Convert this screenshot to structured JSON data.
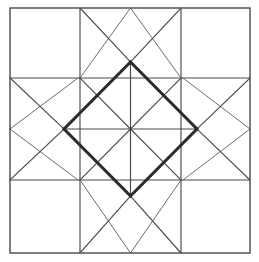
{
  "figure": {
    "name": "quilt-block-diagram",
    "canvas": {
      "width": 259,
      "height": 262,
      "background": "#ffffff"
    },
    "colors": {
      "thin_line": "#4a4a4a",
      "frame_line": "#555555",
      "bold_line": "#2b2b2b",
      "faint_line": "#6d6d6d",
      "background": "#ffffff"
    },
    "geometry": {
      "outer": {
        "left": 10,
        "top": 8,
        "right": 250,
        "bottom": 253
      },
      "grid_x": [
        10,
        80,
        181,
        250
      ],
      "grid_y": [
        8,
        78,
        180,
        253
      ],
      "center": {
        "x": 130.5,
        "y": 129
      },
      "diamond_vertices": {
        "top": {
          "x": 130.5,
          "y": 62
        },
        "right": {
          "x": 197,
          "y": 129
        },
        "bottom": {
          "x": 130.5,
          "y": 196
        },
        "left": {
          "x": 64,
          "y": 129
        }
      }
    },
    "parts": {
      "outer_frame": "outer-square-border",
      "inner_square": "inner-square-between-grid-lines",
      "bold_diamond": "central-bold-diamond",
      "pinwheel": "eight-spoke-center-pinwheel",
      "corner_squares": [
        "top-left-corner-square",
        "top-right-corner-square",
        "bottom-left-corner-square",
        "bottom-right-corner-square"
      ],
      "edge_panels": [
        "top-edge-triangles",
        "right-edge-triangles",
        "bottom-edge-triangles",
        "left-edge-triangles"
      ]
    },
    "lines": {
      "frame": [
        {
          "name": "outer-border",
          "d": "M10,8 L250,8 L250,253 L10,253 Z"
        }
      ],
      "grid": [
        {
          "name": "grid-vertical-left-top",
          "d": "M80,8 L80,78"
        },
        {
          "name": "grid-vertical-right-top",
          "d": "M181,8 L181,78"
        },
        {
          "name": "grid-vertical-left-bottom",
          "d": "M80,180 L80,253"
        },
        {
          "name": "grid-vertical-right-bottom",
          "d": "M181,180 L181,253"
        },
        {
          "name": "grid-horizontal-top-left",
          "d": "M10,78 L80,78"
        },
        {
          "name": "grid-horizontal-top-right",
          "d": "M181,78 L250,78"
        },
        {
          "name": "grid-horizontal-bottom-left",
          "d": "M10,180 L80,180"
        },
        {
          "name": "grid-horizontal-bottom-right",
          "d": "M181,180 L250,180"
        }
      ],
      "inner_square": [
        {
          "name": "inner-square-top",
          "d": "M80,78 L181,78"
        },
        {
          "name": "inner-square-right",
          "d": "M181,78 L181,180"
        },
        {
          "name": "inner-square-bottom",
          "d": "M181,180 L80,180"
        },
        {
          "name": "inner-square-left",
          "d": "M80,180 L80,78"
        }
      ],
      "edge_diagonals": [
        {
          "name": "top-left-diagonal-to-apex",
          "d": "M80,8 L130.5,62"
        },
        {
          "name": "top-right-diagonal-to-apex",
          "d": "M181,8 L130.5,62"
        },
        {
          "name": "bottom-left-diagonal-to-apex",
          "d": "M80,253 L130.5,196"
        },
        {
          "name": "bottom-right-diagonal-to-apex",
          "d": "M181,253 L130.5,196"
        },
        {
          "name": "left-top-diagonal-to-apex",
          "d": "M10,78 L64,129"
        },
        {
          "name": "left-bottom-diagonal-to-apex",
          "d": "M10,180 L64,129"
        },
        {
          "name": "right-top-diagonal-to-apex",
          "d": "M250,78 L197,129"
        },
        {
          "name": "right-bottom-diagonal-to-apex",
          "d": "M250,180 L197,129"
        }
      ],
      "panel_diagonals": [
        {
          "name": "top-panel-left-inner-diagonal",
          "d": "M80,78 L130.5,8"
        },
        {
          "name": "top-panel-right-inner-diagonal",
          "d": "M181,78 L130.5,8"
        },
        {
          "name": "bottom-panel-left-inner-diagonal",
          "d": "M80,180 L130.5,253"
        },
        {
          "name": "bottom-panel-right-inner-diagonal",
          "d": "M181,180 L130.5,253"
        },
        {
          "name": "left-panel-top-inner-diagonal",
          "d": "M78,78 L10,129"
        },
        {
          "name": "left-panel-bottom-inner-diagonal",
          "d": "M78,180 L10,129"
        },
        {
          "name": "right-panel-top-inner-diagonal",
          "d": "M183,78 L250,129"
        },
        {
          "name": "right-panel-bottom-inner-diagonal",
          "d": "M183,180 L250,129"
        }
      ],
      "bold_diamond": [
        {
          "name": "diamond-top-right-edge",
          "d": "M130.5,62 L197,129"
        },
        {
          "name": "diamond-bottom-right-edge",
          "d": "M197,129 L130.5,196"
        },
        {
          "name": "diamond-bottom-left-edge",
          "d": "M130.5,196 L64,129"
        },
        {
          "name": "diamond-top-left-edge",
          "d": "M64,129 L130.5,62"
        }
      ],
      "pinwheel": [
        {
          "name": "pinwheel-spoke-up",
          "d": "M130.5,129 L130.5,62"
        },
        {
          "name": "pinwheel-spoke-down",
          "d": "M130.5,129 L130.5,196"
        },
        {
          "name": "pinwheel-spoke-left",
          "d": "M130.5,129 L64,129"
        },
        {
          "name": "pinwheel-spoke-right",
          "d": "M130.5,129 L197,129"
        },
        {
          "name": "pinwheel-spoke-up-left",
          "d": "M130.5,129 L80,78"
        },
        {
          "name": "pinwheel-spoke-up-right",
          "d": "M130.5,129 L181,78"
        },
        {
          "name": "pinwheel-spoke-down-left",
          "d": "M130.5,129 L80,180"
        },
        {
          "name": "pinwheel-spoke-down-right",
          "d": "M130.5,129 L181,180"
        }
      ]
    }
  }
}
